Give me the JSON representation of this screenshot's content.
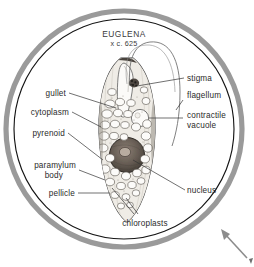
{
  "figure": {
    "title": "EUGLENA",
    "magnification": "x c. 625",
    "colors": {
      "outer_ring": "#9a9a9a",
      "inner_circle": "#1a1a1a",
      "label_text": "#2b2b2b",
      "leader_line": "#333333",
      "cell_outline": "#444444",
      "nucleus": "#5a5048",
      "background": "#ffffff",
      "arrow": "#8c8c8c"
    }
  },
  "labels": {
    "left": [
      {
        "id": "gullet",
        "text": "gullet"
      },
      {
        "id": "cytoplasm",
        "text": "cytoplasm"
      },
      {
        "id": "pyrenoid",
        "text": "pyrenoid"
      },
      {
        "id": "paramylum-body-line1",
        "text": "paramylum"
      },
      {
        "id": "paramylum-body-line2",
        "text": "body"
      },
      {
        "id": "pellicle",
        "text": "pellicle"
      }
    ],
    "right": [
      {
        "id": "stigma",
        "text": "stigma"
      },
      {
        "id": "flagellum",
        "text": "flagellum"
      },
      {
        "id": "contractile-vacuole-line1",
        "text": "contractile"
      },
      {
        "id": "contractile-vacuole-line2",
        "text": "vacuole"
      },
      {
        "id": "nucleus",
        "text": "nucleus"
      }
    ],
    "bottom": [
      {
        "id": "chloroplasts",
        "text": "chloroplasts"
      }
    ]
  },
  "annotations": {
    "pointer_arrow": "arrow-up-left"
  }
}
